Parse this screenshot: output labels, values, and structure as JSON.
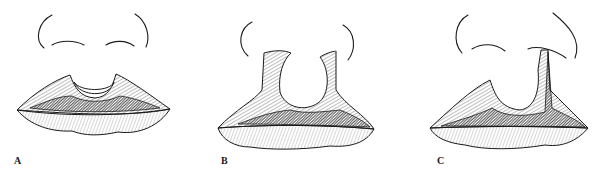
{
  "figure": {
    "panels": [
      {
        "id": "A",
        "label": "A",
        "subject": "lips with notched upper lip, nostrils above"
      },
      {
        "id": "B",
        "label": "B",
        "subject": "upper lip with wide U-shaped central defect reaching nostrils"
      },
      {
        "id": "C",
        "label": "C",
        "subject": "unilateral cleft extending from lip into right nostril"
      }
    ]
  }
}
